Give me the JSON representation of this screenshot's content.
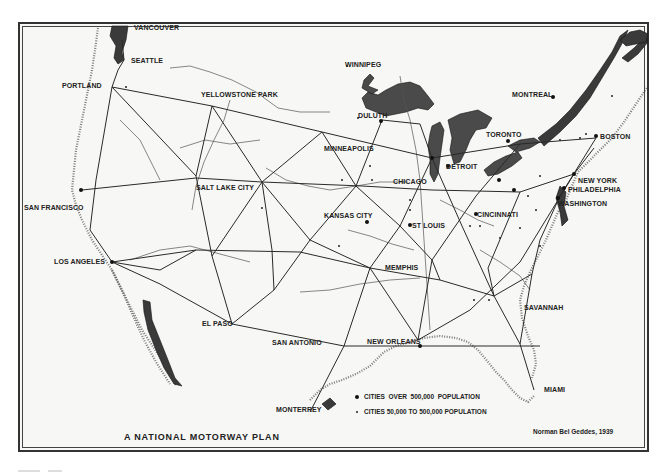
{
  "map": {
    "title": "A NATIONAL MOTORWAY PLAN",
    "credit": "Norman Bel Geddes, 1939",
    "legend": [
      {
        "symbol": "large-dot",
        "label": "CITIES  OVER  500,000  POPULATION"
      },
      {
        "symbol": "small-dot",
        "label": "CITIES 50,000 TO 500,000 POPULATION"
      }
    ],
    "cities": {
      "vancouver": "VANCOUVER",
      "seattle": "SEATTLE",
      "portland": "PORTLAND",
      "yellowstone": "YELLOWSTONE PARK",
      "winnipeg": "WINNIPEG",
      "duluth": "DULUTH",
      "montreal": "MONTREAL",
      "toronto": "TORONTO",
      "boston": "BOSTON",
      "minneapolis": "MINNEAPOLIS",
      "detroit": "DETROIT",
      "chicago": "CHICAGO",
      "new_york": "NEW YORK",
      "philadelphia": "PHILADELPHIA",
      "washington": "WASHINGTON",
      "salt_lake_city": "SALT LAKE CITY",
      "san_francisco": "SAN FRANCISCO",
      "kansas_city": "KANSAS CITY",
      "st_louis": "ST LOUIS",
      "cincinnati": "CINCINNATI",
      "los_angeles": "LOS ANGELES",
      "memphis": "MEMPHIS",
      "savannah": "SAVANNAH",
      "el_paso": "EL PASO",
      "san_antonio": "SAN ANTONIO",
      "new_orleans": "NEW ORLEANS",
      "miami": "MIAMI",
      "monterrey": "MONTERREY"
    },
    "colors": {
      "paper": "#f7f7f5",
      "ink": "#222222"
    }
  }
}
